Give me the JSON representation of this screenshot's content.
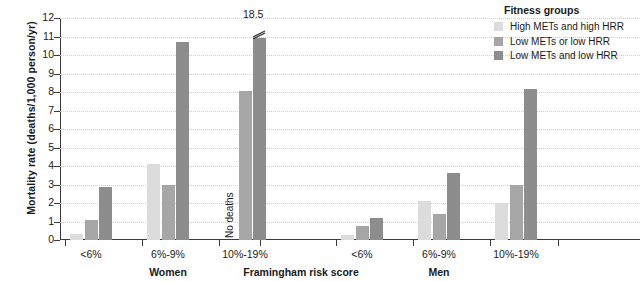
{
  "chart_data": {
    "type": "bar",
    "title": "",
    "xlabel": "Framingham risk score",
    "ylabel": "Mortality rate (deaths/1,000 person/yr)",
    "ylim": [
      0,
      12
    ],
    "yticks": [
      "0",
      "1",
      "2",
      "3",
      "4",
      "5",
      "6",
      "7",
      "8",
      "9",
      "10",
      "11",
      "12"
    ],
    "grid": true,
    "legend_position": "top-right",
    "legend_title": "Fitness groups",
    "series": [
      {
        "name": "High METs and high HRR",
        "color": "#dcdcdc",
        "values": [
          0.3,
          4.1,
          null,
          0.25,
          2.1,
          2.0
        ]
      },
      {
        "name": "Low METs or low HRR",
        "color": "#a6a6a6",
        "values": [
          1.1,
          2.95,
          8.05,
          0.75,
          1.4,
          3.0
        ]
      },
      {
        "name": "Low METs and low HRR",
        "color": "#8d8d8d",
        "values": [
          2.85,
          10.7,
          18.5,
          1.2,
          3.6,
          8.15
        ]
      }
    ],
    "categories": [
      "<6%",
      "6%-9%",
      "10%-19%",
      "<6%",
      "6%-9%",
      "10%-19%"
    ],
    "supergroups": [
      {
        "label": "Women",
        "categories": [
          "<6%",
          "6%-9%",
          "10%-19%"
        ]
      },
      {
        "label": "Men",
        "categories": [
          "<6%",
          "6%-9%",
          "10%-19%"
        ]
      }
    ],
    "annotations": [
      {
        "text": "No deaths",
        "group": "Women",
        "category": "10%-19%",
        "series": "High METs and high HRR",
        "orientation": "vertical"
      },
      {
        "text": "18.5",
        "group": "Women",
        "category": "10%-19%",
        "series": "Low METs and low HRR",
        "note": "axis-break; bar truncated"
      }
    ]
  },
  "legend": {
    "title": "Fitness groups",
    "items": [
      {
        "label": "High METs and high HRR",
        "color": "#dcdcdc"
      },
      {
        "label": "Low METs or low HRR",
        "color": "#a6a6a6"
      },
      {
        "label": "Low METs and low HRR",
        "color": "#8d8d8d"
      }
    ]
  },
  "axes": {
    "y_title": "Mortality rate (deaths/1,000 person/yr)",
    "x_title": "Framingham risk score"
  }
}
